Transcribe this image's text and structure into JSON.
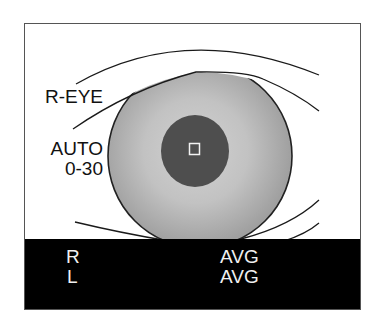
{
  "camera_view": {
    "eye_label": "R-EYE",
    "mode_label": "AUTO",
    "range_label": "0-30",
    "focus_target_icon": "focus-square-icon"
  },
  "status_bar": {
    "rows": [
      {
        "side": "R",
        "value": "AVG"
      },
      {
        "side": "L",
        "value": "AVG"
      }
    ]
  },
  "colors": {
    "iris_outer": "#a4a4a4",
    "iris_inner": "#cfcfcf",
    "pupil": "#4e4e4e",
    "status_bar_bg": "#000000",
    "status_text": "#f0f0f0",
    "frame_border": "#555555"
  }
}
